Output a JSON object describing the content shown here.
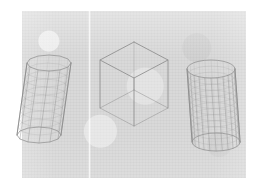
{
  "figure": {
    "panel": {
      "x": 22,
      "y": 11,
      "width": 224,
      "height": 167,
      "background_color": "#d9d9d9"
    },
    "page_background_color": "#ffffff",
    "stroke_color": "#8d8d8d",
    "mesh_color": "#a3a3a3",
    "scan_seam": {
      "x": 88,
      "label": "page-fold-seam"
    },
    "shapes": [
      {
        "id": "left-cylinder",
        "label": "Faceted cylinder (coarse polygonal mesh)",
        "type": "cylinder",
        "center_x": 49,
        "top_y": 63,
        "bottom_y": 135,
        "radius_x": 22,
        "radius_y": 8,
        "facets": 12,
        "rings": 9,
        "tilt_deg": -8
      },
      {
        "id": "center-cube",
        "label": "Wireframe cube (transparent)",
        "type": "cube",
        "center_x": 134,
        "center_y": 78,
        "half_width": 34,
        "half_depth": 18,
        "height": 48,
        "edges": 12
      },
      {
        "id": "right-cylinder",
        "label": "Tessellated cylinder (fine quad mesh)",
        "type": "cylinder",
        "center_x": 211,
        "top_y": 69,
        "bottom_y": 142,
        "radius_x": 24,
        "radius_y": 9,
        "facets": 24,
        "rings": 12,
        "tilt_deg": 4
      }
    ]
  }
}
